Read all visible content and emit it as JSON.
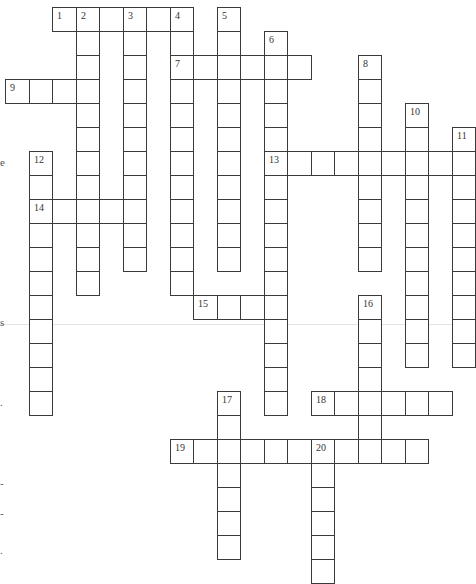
{
  "puzzle": {
    "type": "crossword",
    "layout": {
      "origin_x": 5,
      "origin_y": 7,
      "cell_w": 23.5,
      "cell_h": 24
    },
    "colors": {
      "border": "#3a3a3a",
      "background": "#ffffff",
      "number": "#333333"
    },
    "words": [
      {
        "number": 1,
        "dir": "across",
        "row": 0,
        "col": 2,
        "length": 6
      },
      {
        "number": 2,
        "dir": "down",
        "row": 0,
        "col": 3,
        "length": 12
      },
      {
        "number": 3,
        "dir": "down",
        "row": 0,
        "col": 5,
        "length": 11
      },
      {
        "number": 4,
        "dir": "down",
        "row": 0,
        "col": 7,
        "length": 12
      },
      {
        "number": 5,
        "dir": "down",
        "row": 0,
        "col": 9,
        "length": 11
      },
      {
        "number": 6,
        "dir": "down",
        "row": 1,
        "col": 11,
        "length": 16
      },
      {
        "number": 7,
        "dir": "across",
        "row": 2,
        "col": 7,
        "length": 6
      },
      {
        "number": 8,
        "dir": "down",
        "row": 2,
        "col": 15,
        "length": 9
      },
      {
        "number": 9,
        "dir": "across",
        "row": 3,
        "col": 0,
        "length": 4
      },
      {
        "number": 10,
        "dir": "down",
        "row": 4,
        "col": 17,
        "length": 11
      },
      {
        "number": 11,
        "dir": "down",
        "row": 5,
        "col": 19,
        "length": 10
      },
      {
        "number": 12,
        "dir": "down",
        "row": 6,
        "col": 1,
        "length": 11
      },
      {
        "number": 13,
        "dir": "across",
        "row": 6,
        "col": 11,
        "length": 9
      },
      {
        "number": 14,
        "dir": "across",
        "row": 8,
        "col": 1,
        "length": 5
      },
      {
        "number": 15,
        "dir": "across",
        "row": 12,
        "col": 8,
        "length": 4
      },
      {
        "number": 16,
        "dir": "down",
        "row": 12,
        "col": 15,
        "length": 7
      },
      {
        "number": 17,
        "dir": "down",
        "row": 16,
        "col": 9,
        "length": 7
      },
      {
        "number": 18,
        "dir": "across",
        "row": 16,
        "col": 13,
        "length": 6
      },
      {
        "number": 19,
        "dir": "across",
        "row": 18,
        "col": 7,
        "length": 11
      },
      {
        "number": 20,
        "dir": "down",
        "row": 18,
        "col": 13,
        "length": 6
      }
    ]
  },
  "edge_fragments": [
    {
      "text": "e",
      "y": 156
    },
    {
      "text": "s",
      "y": 316
    },
    {
      "text": ".",
      "y": 396
    },
    {
      "text": "-",
      "y": 477
    },
    {
      "text": "-",
      "y": 507
    },
    {
      "text": ".",
      "y": 544
    }
  ]
}
